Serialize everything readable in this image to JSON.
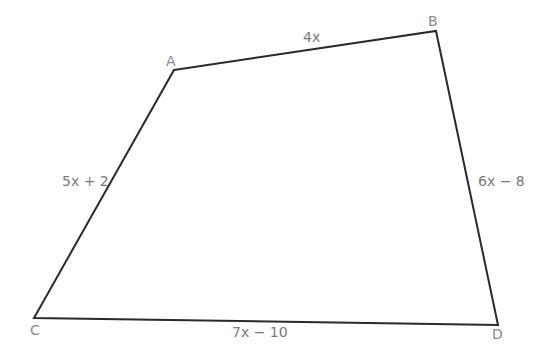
{
  "diagram": {
    "type": "quadrilateral",
    "colors": {
      "stroke": "#2a2a2a",
      "vertex_label": "#8a8a8a",
      "edge_label": "#7a7a7a",
      "background": "#ffffff"
    },
    "vertices": {
      "A": {
        "label": "A",
        "x": 174,
        "y": 70
      },
      "B": {
        "label": "B",
        "x": 436,
        "y": 31
      },
      "C": {
        "label": "C",
        "x": 34,
        "y": 318
      },
      "D": {
        "label": "D",
        "x": 498,
        "y": 325
      }
    },
    "edges": {
      "AB": {
        "label": "4x"
      },
      "BD": {
        "label": "6x − 8"
      },
      "CD": {
        "label": "7x − 10"
      },
      "AC": {
        "label": "5x + 2"
      }
    }
  }
}
